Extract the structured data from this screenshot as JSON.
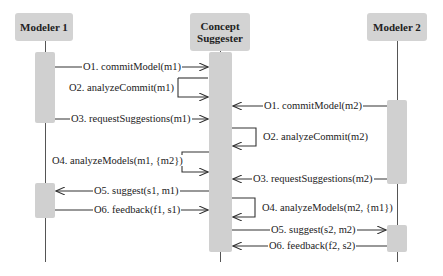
{
  "diagram": {
    "type": "sequence",
    "actors": [
      {
        "id": "m1",
        "label": "Modeler 1"
      },
      {
        "id": "cs",
        "label_line1": "Concept",
        "label_line2": "Suggester"
      },
      {
        "id": "m2",
        "label": "Modeler 2"
      }
    ],
    "messages": [
      {
        "id": "o1_m1",
        "label": "O1. commitModel(m1)",
        "from": "Modeler 1",
        "to": "Concept Suggester"
      },
      {
        "id": "o2_m1",
        "label": "O2. analyzeCommit(m1)",
        "from": "Concept Suggester",
        "to": "Concept Suggester"
      },
      {
        "id": "o3_m1",
        "label": "O3. requestSuggestions(m1)",
        "from": "Modeler 1",
        "to": "Concept Suggester"
      },
      {
        "id": "o1_m2",
        "label": "O1. commitModel(m2)",
        "from": "Modeler 2",
        "to": "Concept Suggester"
      },
      {
        "id": "o2_m2",
        "label": "O2. analyzeCommit(m2)",
        "from": "Concept Suggester",
        "to": "Concept Suggester"
      },
      {
        "id": "o3_m2",
        "label": "O3. requestSuggestions(m2)",
        "from": "Modeler 2",
        "to": "Concept Suggester"
      },
      {
        "id": "o4_m1",
        "label": "O4. analyzeModels(m1, {m2})",
        "from": "Concept Suggester",
        "to": "Concept Suggester"
      },
      {
        "id": "o5_m1",
        "label": "O5. suggest(s1, m1)",
        "from": "Concept Suggester",
        "to": "Modeler 1"
      },
      {
        "id": "o4_m2",
        "label": "O4. analyzeModels(m2, {m1})",
        "from": "Concept Suggester",
        "to": "Concept Suggester"
      },
      {
        "id": "o6_m1",
        "label": "O6. feedback(f1, s1)",
        "from": "Modeler 1",
        "to": "Concept Suggester"
      },
      {
        "id": "o5_m2",
        "label": "O5. suggest(s2, m2)",
        "from": "Concept Suggester",
        "to": "Modeler 2"
      },
      {
        "id": "o6_m2",
        "label": "O6. feedback(f2, s2)",
        "from": "Modeler 2",
        "to": "Concept Suggester"
      }
    ],
    "colors": {
      "actor_fill": "#d3d3d3",
      "activation_fill": "#d0d0d0",
      "line": "#333333",
      "background": "#ffffff"
    }
  }
}
